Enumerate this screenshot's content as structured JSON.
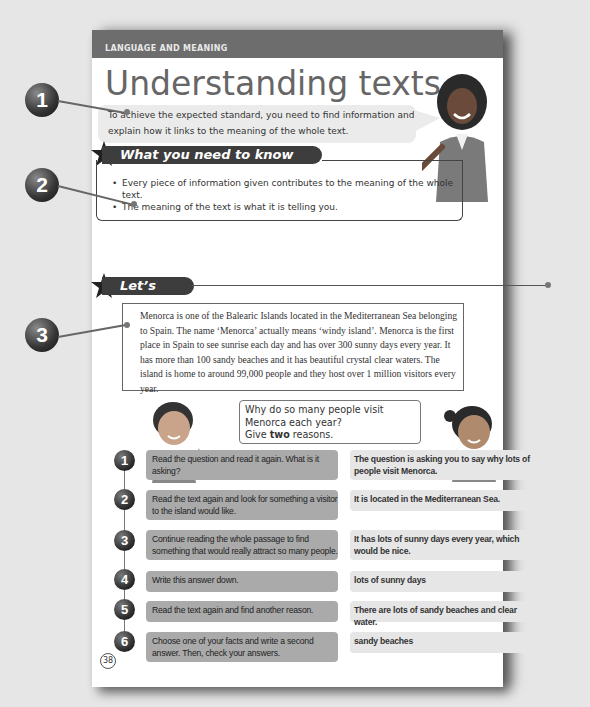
{
  "top_caption": "...y the following example...",
  "page": {
    "banner": "LANGUAGE AND MEANING",
    "title": "Understanding texts",
    "intro": "To achieve the expected standard, you need to find information and explain how it links to the meaning of the whole text.",
    "know_heading": "What you need to know",
    "know_points": [
      "Every piece of information given contributes to the meaning of the whole text.",
      "The meaning of the text is what it is telling you."
    ],
    "practise_heading": "Let’s practise",
    "passage": "Menorca is one of the Balearic Islands located in the Mediterranean Sea belonging to Spain. The name ‘Menorca’ actually means ‘windy island’. Menorca is the first place in Spain to see sunrise each day and has over 300 sunny days every year. It has more than 100 sandy beaches and it has beautiful crystal clear waters. The island is home to around 99,000 people and they host over 1 million visitors every year.",
    "question_line1": "Why do so many people visit Menorca each year?",
    "question_give": "Give ",
    "question_bold": "two",
    "question_end": " reasons.",
    "steps": [
      {
        "num": "1",
        "instruction": "Read the question and read it again. What is it asking?",
        "answer": "The question is asking you to say why lots of people visit Menorca."
      },
      {
        "num": "2",
        "instruction": "Read the text again and look for something a visitor to the island would like.",
        "answer": "It is located in the Mediterranean Sea."
      },
      {
        "num": "3",
        "instruction": "Continue reading the whole passage to find something that would really attract so many people.",
        "answer": "It has lots of sunny days every year, which would be nice."
      },
      {
        "num": "4",
        "instruction": "Write this answer down.",
        "answer": "lots of sunny days"
      },
      {
        "num": "5",
        "instruction": "Read the text again and find another reason.",
        "answer": "There are lots of sandy beaches and clear water."
      },
      {
        "num": "6",
        "instruction": "Choose one of your facts and write a second answer. Then, check your answers.",
        "answer": "sandy beaches"
      }
    ],
    "page_number": "38"
  },
  "callouts": [
    "1",
    "2",
    "3"
  ]
}
